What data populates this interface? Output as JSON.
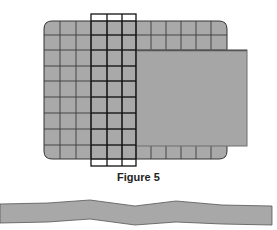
{
  "figure": {
    "caption": "Figure 5",
    "grid": {
      "columns": 12,
      "rows": 9,
      "fill": "#a9a9a9",
      "line_color": "#333333"
    },
    "frame": {
      "columns_spanned": 3,
      "line_color": "#111111"
    },
    "overlay_sheet": {
      "fill": "#a6a6a6",
      "edge": "#6e6e6e"
    },
    "strip": {
      "fill": "#a8a8a8",
      "edge": "#555555"
    }
  }
}
